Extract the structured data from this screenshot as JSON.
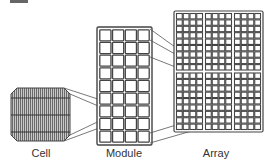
{
  "diagram": {
    "nodes": [
      {
        "id": "cell",
        "label": "Cell"
      },
      {
        "id": "module",
        "label": "Module",
        "grid": {
          "cols": 4,
          "rows": 9
        }
      },
      {
        "id": "array",
        "label": "Array",
        "panel_grid": {
          "cols": 3,
          "rows": 2
        },
        "cells_per_panel": {
          "cols": 4,
          "rows": 9
        }
      }
    ],
    "edges": [
      {
        "from": "cell",
        "to": "module"
      },
      {
        "from": "module",
        "to": "array"
      }
    ],
    "colors": {
      "stroke": "#444444",
      "cell_fill": "#9a9a9a",
      "grid_bg": "#ffffff",
      "text": "#333333"
    }
  },
  "labels": {
    "cell": "Cell",
    "module": "Module",
    "array": "Array"
  }
}
